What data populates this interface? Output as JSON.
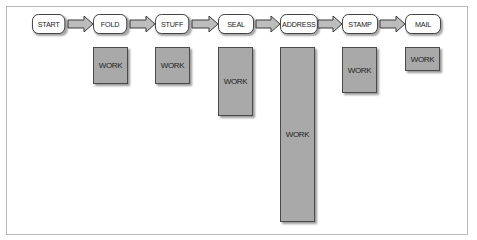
{
  "diagram": {
    "title": "",
    "stages": [
      {
        "label": "START",
        "work": null
      },
      {
        "label": "FOLD",
        "work": "WORK"
      },
      {
        "label": "STUFF",
        "work": "WORK"
      },
      {
        "label": "SEAL",
        "work": "WORK"
      },
      {
        "label": "ADDRESS",
        "work": "WORK"
      },
      {
        "label": "STAMP",
        "work": "WORK"
      },
      {
        "label": "MAIL",
        "work": "WORK"
      }
    ],
    "work_label": "WORK",
    "edges": [
      [
        "START",
        "FOLD"
      ],
      [
        "FOLD",
        "STUFF"
      ],
      [
        "STUFF",
        "SEAL"
      ],
      [
        "SEAL",
        "ADDRESS"
      ],
      [
        "ADDRESS",
        "STAMP"
      ],
      [
        "STAMP",
        "MAIL"
      ]
    ],
    "colors": {
      "node_fill": "#ffffff",
      "node_border": "#3a3a3a",
      "work_fill": "#a9a9a9",
      "arrow_fill": "#bdbdbd",
      "frame_border": "#b8b8b8"
    }
  }
}
